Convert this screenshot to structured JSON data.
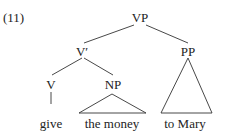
{
  "example_number": "(11)",
  "tree": {
    "root": "VP",
    "vbar": "V′",
    "pp": "PP",
    "v": "V",
    "np": "NP"
  },
  "leaves": {
    "give": "give",
    "the_money": "the money",
    "to_mary": "to Mary"
  }
}
